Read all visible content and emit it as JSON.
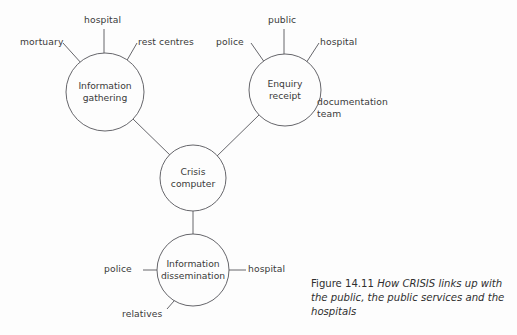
{
  "figure": {
    "caption_number": "Figure 14.11",
    "caption_text": "How CRISIS links up with the public, the public services and the hospitals",
    "background_color": "#fdfdfd",
    "stroke_color": "#55555a",
    "text_color": "#3a3a3a"
  },
  "diagram": {
    "type": "node-link-diagram",
    "nodes": [
      {
        "id": "information-gathering",
        "line1": "Information",
        "line2": "gathering",
        "cx": 105,
        "cy": 92,
        "r": 39
      },
      {
        "id": "enquiry-receipt",
        "line1": "Enquiry",
        "line2": "receipt",
        "cx": 285,
        "cy": 90,
        "r": 36
      },
      {
        "id": "crisis-computer",
        "line1": "Crisis",
        "line2": "computer",
        "cx": 193,
        "cy": 178,
        "r": 33
      },
      {
        "id": "information-dissemination",
        "line1": "Information",
        "line2": "dissemination",
        "cx": 193,
        "cy": 270,
        "r": 36
      }
    ],
    "edges": [
      {
        "from": "information-gathering",
        "to": "crisis-computer"
      },
      {
        "from": "enquiry-receipt",
        "to": "crisis-computer"
      },
      {
        "from": "crisis-computer",
        "to": "information-dissemination"
      }
    ],
    "leaves": [
      {
        "id": "mortuary",
        "label": "mortuary",
        "parent": "information-gathering",
        "x": 20,
        "y": 37
      },
      {
        "id": "hospital-gathering",
        "label": "hospital",
        "parent": "information-gathering",
        "x": 84,
        "y": 15
      },
      {
        "id": "rest-centres",
        "label": "rest centres",
        "parent": "information-gathering",
        "x": 138,
        "y": 37
      },
      {
        "id": "police-enquiry",
        "label": "police",
        "parent": "enquiry-receipt",
        "x": 216,
        "y": 37
      },
      {
        "id": "public",
        "label": "public",
        "parent": "enquiry-receipt",
        "x": 268,
        "y": 15
      },
      {
        "id": "hospital-enquiry",
        "label": "hospital",
        "parent": "enquiry-receipt",
        "x": 320,
        "y": 37
      },
      {
        "id": "documentation-team",
        "label": "documentation\nteam",
        "parent": "enquiry-receipt",
        "x": 317,
        "y": 97
      },
      {
        "id": "police-dissemination",
        "label": "police",
        "parent": "information-dissemination",
        "x": 104,
        "y": 264
      },
      {
        "id": "hospital-dissemination",
        "label": "hospital",
        "parent": "information-dissemination",
        "x": 248,
        "y": 264
      },
      {
        "id": "relatives",
        "label": "relatives",
        "parent": "information-dissemination",
        "x": 122,
        "y": 309
      }
    ]
  }
}
